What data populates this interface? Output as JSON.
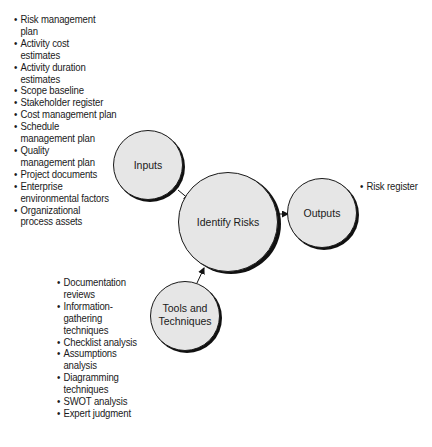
{
  "diagram": {
    "nodes": {
      "inputs": {
        "label": "Inputs"
      },
      "process": {
        "label": "Identify Risks"
      },
      "outputs": {
        "label": "Outputs"
      },
      "tools": {
        "label_line1": "Tools and",
        "label_line2": "Techniques"
      }
    },
    "edges": [
      {
        "from": "Inputs",
        "to": "Identify Risks"
      },
      {
        "from": "Tools and Techniques",
        "to": "Identify Risks"
      },
      {
        "from": "Identify Risks",
        "to": "Outputs"
      }
    ],
    "colors": {
      "circle_fill": "#e6e6e6",
      "circle_stroke": "#1a1a1a",
      "shadow": "#111111",
      "text": "#1a1a1a"
    }
  },
  "lists": {
    "bullet": "•",
    "inputs": [
      "Risk management plan",
      "Activity cost estimates",
      "Activity duration estimates",
      "Scope baseline",
      "Stakeholder register",
      "Cost management plan",
      "Schedule management plan",
      "Quality management plan",
      "Project documents",
      "Enterprise environmental factors",
      "Organizational process assets"
    ],
    "tools": [
      "Documentation reviews",
      "Information-gathering techniques",
      "Checklist analysis",
      "Assumptions analysis",
      "Diagramming techniques",
      "SWOT analysis",
      "Expert judgment"
    ],
    "outputs": [
      "Risk register"
    ]
  }
}
